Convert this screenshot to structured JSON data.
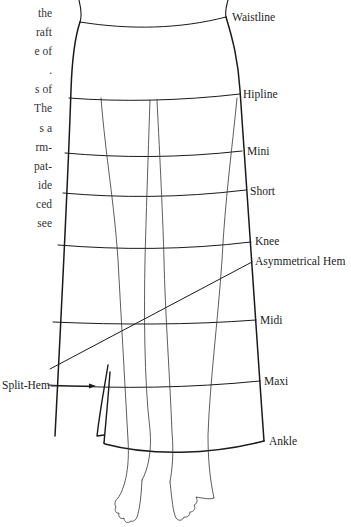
{
  "paragraph_fragment": {
    "lines": [
      "the",
      "raft",
      "e of",
      ".",
      "s of",
      "The",
      "s a",
      "rm-",
      "pat-",
      "ide",
      "ced",
      "see"
    ]
  },
  "diagram": {
    "labels": {
      "waistline": "Waistline",
      "hipline": "Hipline",
      "mini": "Mini",
      "short": "Short",
      "knee": "Knee",
      "asymmetrical_hem": "Asymmetrical Hem",
      "midi": "Midi",
      "maxi": "Maxi",
      "ankle": "Ankle",
      "split_hem": "Split-Hem"
    },
    "stroke_color": "#1a1a1a",
    "background": "#ffffff"
  }
}
